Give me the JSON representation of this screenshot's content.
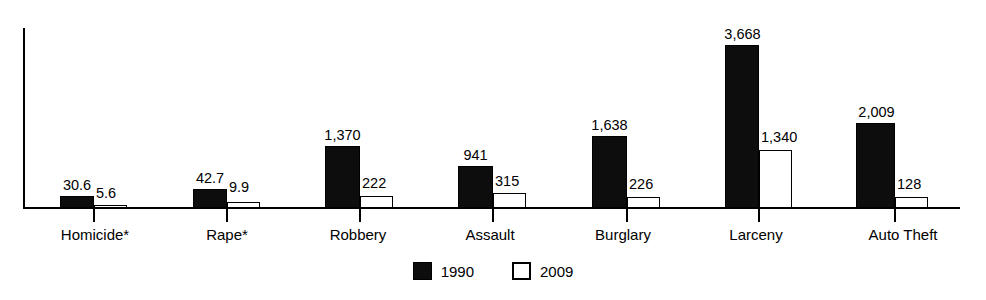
{
  "chart_data": {
    "type": "bar",
    "title": "",
    "subtitle": "",
    "xlabel": "",
    "ylabel": "",
    "grid": false,
    "legend_position": "bottom-center",
    "axis": {
      "y_tick_labels": [],
      "x_tick_labels": [
        "Homicide*",
        "Rape*",
        "Robbery",
        "Assault",
        "Burglary",
        "Larceny",
        "Auto Theft"
      ],
      "note": "Homicide* and Rape* are plotted on a different (per-100,000) rate scale than the remaining categories"
    },
    "categories": [
      "Homicide*",
      "Rape*",
      "Robbery",
      "Assault",
      "Burglary",
      "Larceny",
      "Auto Theft"
    ],
    "series": [
      {
        "name": "1990",
        "color": "#0d0d0d",
        "style": "filled",
        "values": [
          30.6,
          42.7,
          1370,
          941,
          1638,
          3668,
          2009
        ],
        "value_labels": [
          "30.6",
          "42.7",
          "1,370",
          "941",
          "1,638",
          "3,668",
          "2,009"
        ]
      },
      {
        "name": "2009",
        "color": "#ffffff",
        "style": "outline",
        "values": [
          5.6,
          9.9,
          222,
          315,
          226,
          1340,
          128
        ],
        "value_labels": [
          "5.6",
          "9.9",
          "222",
          "315",
          "226",
          "1,340",
          "128"
        ]
      }
    ]
  },
  "legend": {
    "entries": [
      {
        "label": "1990",
        "swatch": "filled-black-square"
      },
      {
        "label": "2009",
        "swatch": "open-white-square"
      }
    ]
  },
  "colors": {
    "series_1990": "#0d0d0d",
    "series_2009": "#ffffff",
    "axis": "#000000",
    "background": "#ffffff",
    "text": "#000000"
  },
  "geometry": {
    "baseline_y": 208,
    "groups": [
      {
        "cat_index": 0,
        "bar1990": {
          "x": 60,
          "w": 34,
          "top": 196
        },
        "bar2009": {
          "x": 94,
          "w": 33,
          "top": 205
        },
        "label1990": {
          "x": 44,
          "y": 178,
          "w": 66
        },
        "label2009": {
          "x": 96,
          "y": 186
        },
        "tick_x": 93,
        "cat_x": 36,
        "cat_w": 118
      },
      {
        "cat_index": 1,
        "bar1990": {
          "x": 193,
          "w": 34,
          "top": 189
        },
        "bar2009": {
          "x": 227,
          "w": 33,
          "top": 202
        },
        "label1990": {
          "x": 177,
          "y": 171,
          "w": 66
        },
        "label2009": {
          "x": 229,
          "y": 180
        },
        "tick_x": 226,
        "cat_x": 172,
        "cat_w": 110
      },
      {
        "cat_index": 2,
        "bar1990": {
          "x": 325,
          "w": 35,
          "top": 146
        },
        "bar2009": {
          "x": 360,
          "w": 33,
          "top": 196
        },
        "label1990": {
          "x": 301,
          "y": 128,
          "w": 83
        },
        "label2009": {
          "x": 362,
          "y": 176
        },
        "tick_x": 359,
        "cat_x": 298,
        "cat_w": 120
      },
      {
        "cat_index": 3,
        "bar1990": {
          "x": 458,
          "w": 35,
          "top": 166
        },
        "bar2009": {
          "x": 493,
          "w": 33,
          "top": 193
        },
        "label1990": {
          "x": 440,
          "y": 148,
          "w": 71
        },
        "label2009": {
          "x": 495,
          "y": 174
        },
        "tick_x": 492,
        "cat_x": 432,
        "cat_w": 116
      },
      {
        "cat_index": 4,
        "bar1990": {
          "x": 592,
          "w": 35,
          "top": 136
        },
        "bar2009": {
          "x": 627,
          "w": 33,
          "top": 197
        },
        "label1990": {
          "x": 568,
          "y": 118,
          "w": 83
        },
        "label2009": {
          "x": 629,
          "y": 177
        },
        "tick_x": 626,
        "cat_x": 562,
        "cat_w": 122
      },
      {
        "cat_index": 5,
        "bar1990": {
          "x": 725,
          "w": 34,
          "top": 45
        },
        "bar2009": {
          "x": 759,
          "w": 33,
          "top": 150
        },
        "label1990": {
          "x": 701,
          "y": 27,
          "w": 83
        },
        "label2009": {
          "x": 761,
          "y": 130
        },
        "tick_x": 758,
        "cat_x": 700,
        "cat_w": 112
      },
      {
        "cat_index": 6,
        "bar1990": {
          "x": 856,
          "w": 39,
          "top": 123
        },
        "bar2009": {
          "x": 895,
          "w": 33,
          "top": 197
        },
        "label1990": {
          "x": 835,
          "y": 105,
          "w": 83
        },
        "label2009": {
          "x": 897,
          "y": 177
        },
        "tick_x": 894,
        "cat_x": 840,
        "cat_w": 126
      }
    ]
  }
}
